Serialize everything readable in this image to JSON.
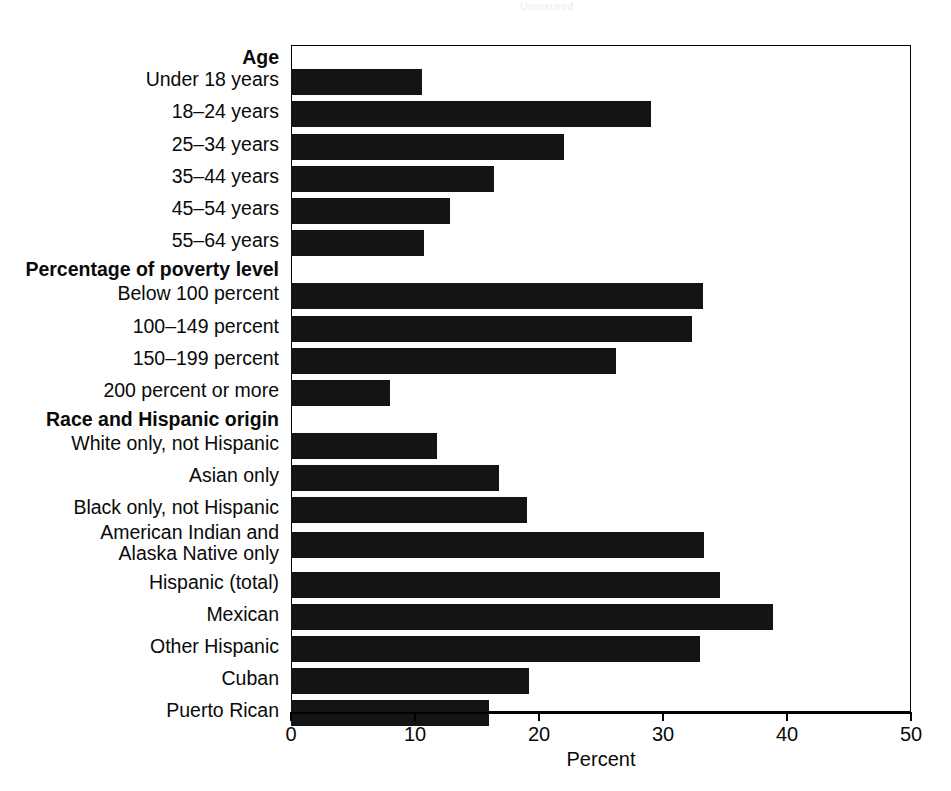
{
  "artifact": {
    "bleed_text": "Uninsured"
  },
  "chart": {
    "x_axis_title": "Percent",
    "x_ticks": [
      "0",
      "10",
      "20",
      "30",
      "40",
      "50"
    ],
    "bar_color": "#141414",
    "axis_color": "#000000"
  },
  "chart_data": {
    "type": "bar",
    "orientation": "horizontal",
    "title": "",
    "xlabel": "Percent",
    "ylabel": "",
    "xlim": [
      0,
      50
    ],
    "xticks": [
      0,
      10,
      20,
      30,
      40,
      50
    ],
    "grid": false,
    "legend": false,
    "groups": [
      {
        "heading": "Age",
        "categories": [
          "Under 18 years",
          "18–24 years",
          "25–34 years",
          "35–44 years",
          "45–54 years",
          "55–64 years"
        ],
        "values": [
          10.6,
          29.0,
          22.0,
          16.4,
          12.8,
          10.7
        ]
      },
      {
        "heading": "Percentage of poverty level",
        "categories": [
          "Below 100 percent",
          "100–149 percent",
          "150–199 percent",
          "200 percent or more"
        ],
        "values": [
          33.2,
          32.3,
          26.2,
          8.0
        ]
      },
      {
        "heading": "Race and Hispanic origin",
        "categories": [
          "White only, not Hispanic",
          "Asian only",
          "Black only, not Hispanic",
          "American Indian and\nAlaska Native only",
          "Hispanic (total)",
          "Mexican",
          "Other Hispanic",
          "Cuban",
          "Puerto Rican"
        ],
        "values": [
          11.8,
          16.8,
          19.0,
          33.3,
          34.6,
          38.9,
          33.0,
          19.2,
          16.0
        ]
      }
    ],
    "categories": [
      "Under 18 years",
      "18–24 years",
      "25–34 years",
      "35–44 years",
      "45–54 years",
      "55–64 years",
      "Below 100 percent",
      "100–149 percent",
      "150–199 percent",
      "200 percent or more",
      "White only, not Hispanic",
      "Asian only",
      "Black only, not Hispanic",
      "American Indian and Alaska Native only",
      "Hispanic (total)",
      "Mexican",
      "Other Hispanic",
      "Cuban",
      "Puerto Rican"
    ],
    "values": [
      10.6,
      29.0,
      22.0,
      16.4,
      12.8,
      10.7,
      33.2,
      32.3,
      26.2,
      8.0,
      11.8,
      16.8,
      19.0,
      33.3,
      34.6,
      38.9,
      33.0,
      19.2,
      16.0
    ]
  },
  "rows": [
    {
      "label": "Age",
      "type": "group",
      "top": 0,
      "label_top": 2
    },
    {
      "label": "Under 18 years",
      "type": "bar",
      "value": 10.6,
      "bar_top": 24,
      "label_top": 24
    },
    {
      "label": "18–24 years",
      "type": "bar",
      "value": 29.0,
      "bar_top": 56,
      "label_top": 56
    },
    {
      "label": "25–34 years",
      "type": "bar",
      "value": 22.0,
      "bar_top": 89,
      "label_top": 89
    },
    {
      "label": "35–44 years",
      "type": "bar",
      "value": 16.4,
      "bar_top": 121,
      "label_top": 121
    },
    {
      "label": "45–54 years",
      "type": "bar",
      "value": 12.8,
      "bar_top": 153,
      "label_top": 153
    },
    {
      "label": "55–64 years",
      "type": "bar",
      "value": 10.7,
      "bar_top": 185,
      "label_top": 185
    },
    {
      "label": "Percentage of poverty level",
      "type": "group",
      "top": 214,
      "label_top": 214
    },
    {
      "label": "Below 100 percent",
      "type": "bar",
      "value": 33.2,
      "bar_top": 238,
      "label_top": 238
    },
    {
      "label": "100–149 percent",
      "type": "bar",
      "value": 32.3,
      "bar_top": 271,
      "label_top": 271
    },
    {
      "label": "150–199 percent",
      "type": "bar",
      "value": 26.2,
      "bar_top": 303,
      "label_top": 303
    },
    {
      "label": "200 percent or more",
      "type": "bar",
      "value": 8.0,
      "bar_top": 335,
      "label_top": 335
    },
    {
      "label": "Race and Hispanic origin",
      "type": "group",
      "top": 364,
      "label_top": 364
    },
    {
      "label": "White only, not Hispanic",
      "type": "bar",
      "value": 11.8,
      "bar_top": 388,
      "label_top": 388
    },
    {
      "label": "Asian only",
      "type": "bar",
      "value": 16.8,
      "bar_top": 420,
      "label_top": 420
    },
    {
      "label": "Black only, not Hispanic",
      "type": "bar",
      "value": 19.0,
      "bar_top": 452,
      "label_top": 452
    },
    {
      "label": "American Indian and\nAlaska Native only",
      "type": "bar",
      "value": 33.3,
      "bar_top": 487,
      "label_top": 477
    },
    {
      "label": "Hispanic (total)",
      "type": "bar",
      "value": 34.6,
      "bar_top": 527,
      "label_top": 527
    },
    {
      "label": "Mexican",
      "type": "bar",
      "value": 38.9,
      "bar_top": 559,
      "label_top": 559
    },
    {
      "label": "Other Hispanic",
      "type": "bar",
      "value": 33.0,
      "bar_top": 591,
      "label_top": 591
    },
    {
      "label": "Cuban",
      "type": "bar",
      "value": 19.2,
      "bar_top": 623,
      "label_top": 623
    },
    {
      "label": "Puerto Rican",
      "type": "bar",
      "value": 16.0,
      "bar_top": 655,
      "label_top": 655
    }
  ]
}
